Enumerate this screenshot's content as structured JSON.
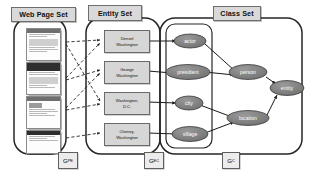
{
  "diagram": {
    "panels": [
      {
        "id": "webpage",
        "label": "Web Page Set"
      },
      {
        "id": "entity",
        "label": "Entity Set"
      },
      {
        "id": "class",
        "label": "Class Set"
      }
    ],
    "graph_labels": [
      {
        "id": "g-pe",
        "base": "G",
        "sub": "PE"
      },
      {
        "id": "g-ec",
        "base": "G",
        "sub": "EC"
      },
      {
        "id": "g-c",
        "base": "G",
        "sub": "C"
      }
    ],
    "web_pages": [
      {
        "id": "page-1",
        "alt": "web page thumbnail 1"
      },
      {
        "id": "page-2",
        "alt": "web page thumbnail 2"
      },
      {
        "id": "page-3",
        "alt": "web page thumbnail 3"
      },
      {
        "id": "page-4",
        "alt": "web page thumbnail 4"
      }
    ],
    "entities": [
      {
        "id": "ent-denzel",
        "line1": "Denzel",
        "line2": "Washington"
      },
      {
        "id": "ent-george",
        "line1": "George",
        "line2": "Washington"
      },
      {
        "id": "ent-dc",
        "line1": "Washington,",
        "line2": "D.C."
      },
      {
        "id": "ent-cheney",
        "line1": "Cheney,",
        "line2": "Washington"
      }
    ],
    "classes": [
      {
        "id": "cls-actor",
        "label": "actor"
      },
      {
        "id": "cls-president",
        "label": "president"
      },
      {
        "id": "cls-city",
        "label": "city"
      },
      {
        "id": "cls-village",
        "label": "village"
      },
      {
        "id": "cls-person",
        "label": "person"
      },
      {
        "id": "cls-location",
        "label": "location"
      },
      {
        "id": "cls-entity",
        "label": "entity"
      }
    ],
    "edges_page_to_entity": [
      {
        "from": "page-1",
        "to": "ent-denzel",
        "style": "dashed"
      },
      {
        "from": "page-1",
        "to": "ent-dc",
        "style": "dashed"
      },
      {
        "from": "page-2",
        "to": "ent-denzel",
        "style": "dashed"
      },
      {
        "from": "page-2",
        "to": "ent-george",
        "style": "dashed"
      },
      {
        "from": "page-3",
        "to": "ent-george",
        "style": "dashed"
      },
      {
        "from": "page-3",
        "to": "ent-dc",
        "style": "dashed"
      },
      {
        "from": "page-4",
        "to": "ent-cheney",
        "style": "dashed"
      }
    ],
    "edges_entity_to_class": [
      {
        "from": "ent-denzel",
        "to": "cls-actor",
        "style": "solid"
      },
      {
        "from": "ent-george",
        "to": "cls-president",
        "style": "solid"
      },
      {
        "from": "ent-dc",
        "to": "cls-city",
        "style": "solid"
      },
      {
        "from": "ent-cheney",
        "to": "cls-village",
        "style": "solid"
      }
    ],
    "edges_class_hierarchy": [
      {
        "from": "cls-actor",
        "to": "cls-person",
        "style": "solid"
      },
      {
        "from": "cls-president",
        "to": "cls-person",
        "style": "solid"
      },
      {
        "from": "cls-city",
        "to": "cls-location",
        "style": "solid"
      },
      {
        "from": "cls-village",
        "to": "cls-location",
        "style": "solid"
      },
      {
        "from": "cls-person",
        "to": "cls-entity",
        "style": "solid"
      },
      {
        "from": "cls-location",
        "to": "cls-entity",
        "style": "solid"
      }
    ],
    "colors": {
      "panel_border": "#262626",
      "node_fill": "#808080",
      "node_stroke": "#3a3a3a",
      "box_fill": "#d6d6d6",
      "header_fill": "#d9d9d9",
      "edge": "#1a1a1a"
    }
  }
}
